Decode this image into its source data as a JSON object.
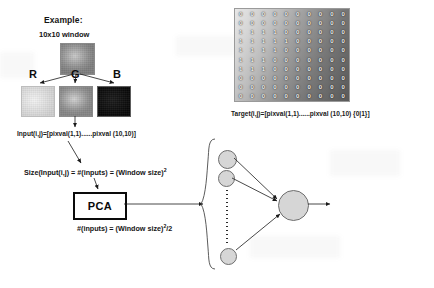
{
  "diagram": {
    "title": "Example:",
    "subtitle": "10x10 window",
    "channels": [
      {
        "label": "R",
        "name": "red-channel"
      },
      {
        "label": "G",
        "name": "green-channel"
      },
      {
        "label": "B",
        "name": "blue-channel"
      }
    ],
    "input_vector_label": "Input(i,j)=[pixval(1,1)......pixval (10,10)]",
    "size_equation_prefix": "Size(Input(i,j) = #(inputs) = (Window size)",
    "size_equation_exponent": "2",
    "pca_label": "PCA",
    "reduced_equation_prefix": "#(inputs) = (Window size)",
    "reduced_equation_exponent": "2",
    "reduced_equation_suffix": "/2",
    "target_caption": "Target(i,j)=[pixval(1,1)......pixval (10,10) {0|1}]",
    "target_matrix": {
      "rows": 10,
      "cols": 10,
      "values": [
        [
          0,
          0,
          0,
          0,
          0,
          0,
          0,
          0,
          0,
          0
        ],
        [
          0,
          0,
          0,
          0,
          0,
          0,
          0,
          0,
          0,
          0
        ],
        [
          1,
          1,
          1,
          1,
          0,
          0,
          0,
          0,
          0,
          0
        ],
        [
          1,
          1,
          1,
          1,
          1,
          0,
          0,
          0,
          0,
          0
        ],
        [
          1,
          1,
          1,
          1,
          0,
          0,
          0,
          0,
          0,
          0
        ],
        [
          1,
          1,
          1,
          0,
          0,
          0,
          0,
          0,
          0,
          0
        ],
        [
          1,
          1,
          1,
          0,
          0,
          0,
          0,
          0,
          0,
          0
        ],
        [
          0,
          0,
          0,
          0,
          0,
          0,
          0,
          0,
          0,
          0
        ],
        [
          0,
          0,
          0,
          0,
          0,
          0,
          0,
          0,
          0,
          0
        ],
        [
          0,
          0,
          0,
          0,
          0,
          0,
          0,
          0,
          0,
          0
        ]
      ]
    },
    "network": {
      "input_nodes": 3,
      "output_nodes": 1,
      "ellipsis": "vertical-dotted-line"
    },
    "colors": {
      "ink": "#141414",
      "node_fill": "#d6d6d6",
      "node_stroke": "#6e6e6e",
      "box_stroke": "#0a0a0a"
    }
  }
}
